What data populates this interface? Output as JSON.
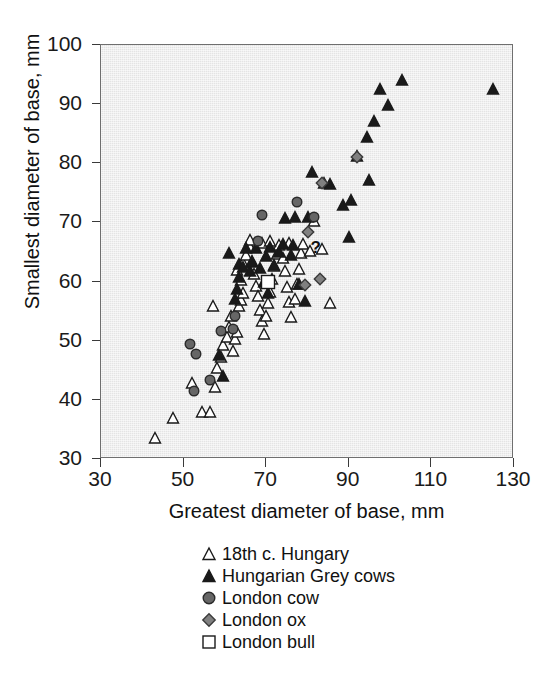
{
  "chart_data": {
    "type": "scatter",
    "title": "",
    "xlabel": "Greatest diameter of base, mm",
    "ylabel": "Smallest diameter of base, mm",
    "xlim": [
      30,
      130
    ],
    "ylim": [
      30,
      100
    ],
    "xticks": [
      30,
      50,
      70,
      90,
      110,
      130
    ],
    "yticks": [
      30,
      40,
      50,
      60,
      70,
      80,
      90,
      100
    ],
    "grid": false,
    "legend_position": "below-axes-center",
    "plot_background": "#e4e4e4",
    "annotations": [
      {
        "text": "?",
        "x": 82.0,
        "y": 65.6
      }
    ],
    "series": [
      {
        "name": "18th c. Hungary",
        "marker": "triangle-up",
        "fill": "#ffffff",
        "edge": "#1a1a1a",
        "points": [
          [
            43.0,
            33.6
          ],
          [
            47.5,
            37.0
          ],
          [
            52.0,
            42.9
          ],
          [
            54.5,
            38.0
          ],
          [
            56.5,
            38.0
          ],
          [
            57.5,
            42.1
          ],
          [
            58.0,
            45.4
          ],
          [
            59.0,
            47.3
          ],
          [
            59.5,
            49.2
          ],
          [
            60.5,
            50.6
          ],
          [
            61.0,
            52.3
          ],
          [
            61.5,
            54.1
          ],
          [
            62.0,
            48.2
          ],
          [
            62.5,
            50.3
          ],
          [
            63.0,
            51.5
          ],
          [
            63.5,
            55.8
          ],
          [
            64.0,
            56.9
          ],
          [
            64.5,
            58.0
          ],
          [
            64.0,
            60.2
          ],
          [
            63.0,
            62.0
          ],
          [
            64.5,
            63.1
          ],
          [
            65.0,
            64.5
          ],
          [
            66.0,
            65.8
          ],
          [
            66.5,
            63.4
          ],
          [
            67.0,
            61.2
          ],
          [
            67.5,
            59.3
          ],
          [
            68.0,
            57.6
          ],
          [
            68.5,
            55.2
          ],
          [
            69.0,
            53.3
          ],
          [
            69.5,
            51.2
          ],
          [
            70.0,
            54.2
          ],
          [
            70.5,
            56.4
          ],
          [
            71.0,
            58.3
          ],
          [
            71.5,
            60.4
          ],
          [
            72.0,
            62.6
          ],
          [
            72.5,
            64.6
          ],
          [
            73.0,
            66.2
          ],
          [
            74.0,
            64.0
          ],
          [
            74.5,
            61.8
          ],
          [
            75.0,
            59.1
          ],
          [
            75.5,
            56.6
          ],
          [
            76.0,
            54.0
          ],
          [
            77.0,
            57.1
          ],
          [
            77.5,
            59.6
          ],
          [
            78.0,
            62.1
          ],
          [
            78.5,
            64.8
          ],
          [
            79.0,
            66.4
          ],
          [
            80.5,
            65.1
          ],
          [
            81.5,
            70.3
          ],
          [
            83.5,
            65.5
          ],
          [
            85.5,
            56.3
          ],
          [
            57.0,
            55.8
          ],
          [
            66.0,
            67.0
          ],
          [
            69.0,
            66.6
          ],
          [
            71.0,
            66.9
          ],
          [
            75.5,
            66.6
          ]
        ]
      },
      {
        "name": "Hungarian Grey cows",
        "marker": "triangle-up",
        "fill": "#1a1a1a",
        "edge": "#1a1a1a",
        "points": [
          [
            59.5,
            44.0
          ],
          [
            58.5,
            47.6
          ],
          [
            62.5,
            57.0
          ],
          [
            63.0,
            58.8
          ],
          [
            63.5,
            60.7
          ],
          [
            61.0,
            64.9
          ],
          [
            63.5,
            63.0
          ],
          [
            64.5,
            62.4
          ],
          [
            65.0,
            65.6
          ],
          [
            66.0,
            61.8
          ],
          [
            66.5,
            63.3
          ],
          [
            67.5,
            65.7
          ],
          [
            68.5,
            62.3
          ],
          [
            69.5,
            60.0
          ],
          [
            70.5,
            58.0
          ],
          [
            70.0,
            64.3
          ],
          [
            71.0,
            65.9
          ],
          [
            72.0,
            62.8
          ],
          [
            73.0,
            65.0
          ],
          [
            74.0,
            66.3
          ],
          [
            74.5,
            70.7
          ],
          [
            76.0,
            64.5
          ],
          [
            76.5,
            66.2
          ],
          [
            77.0,
            71.0
          ],
          [
            78.0,
            59.6
          ],
          [
            79.5,
            56.7
          ],
          [
            80.0,
            70.9
          ],
          [
            81.0,
            78.6
          ],
          [
            84.0,
            76.6
          ],
          [
            85.5,
            76.5
          ],
          [
            88.5,
            72.9
          ],
          [
            90.0,
            67.5
          ],
          [
            90.5,
            73.8
          ],
          [
            92.0,
            81.2
          ],
          [
            94.5,
            84.4
          ],
          [
            95.0,
            77.1
          ],
          [
            96.0,
            87.1
          ],
          [
            97.5,
            92.6
          ],
          [
            99.5,
            89.9
          ],
          [
            103.0,
            94.0
          ],
          [
            125.0,
            92.6
          ]
        ]
      },
      {
        "name": "London cow",
        "marker": "circle",
        "fill": "#666666",
        "edge": "#2b2b2b",
        "points": [
          [
            52.5,
            41.5
          ],
          [
            53.0,
            47.8
          ],
          [
            56.5,
            43.3
          ],
          [
            59.0,
            51.6
          ],
          [
            62.0,
            51.9
          ],
          [
            62.5,
            54.2
          ],
          [
            69.0,
            71.3
          ],
          [
            68.0,
            66.8
          ],
          [
            77.5,
            73.4
          ],
          [
            81.5,
            70.9
          ],
          [
            51.5,
            49.5
          ]
        ]
      },
      {
        "name": "London ox",
        "marker": "diamond",
        "fill": "#808080",
        "edge": "#3a3a3a",
        "points": [
          [
            79.5,
            59.5
          ],
          [
            83.0,
            60.5
          ],
          [
            80.0,
            68.3
          ],
          [
            83.5,
            76.7
          ],
          [
            92.0,
            81.1
          ]
        ]
      },
      {
        "name": "London bull",
        "marker": "square",
        "fill": "#ffffff",
        "edge": "#1a1a1a",
        "points": [
          [
            70.5,
            59.9
          ]
        ]
      }
    ]
  },
  "axes": {
    "x_label": "Greatest diameter of base, mm",
    "y_label": "Smallest diameter of base, mm",
    "x_tick_labels": [
      "30",
      "50",
      "70",
      "90",
      "110",
      "130"
    ],
    "y_tick_labels": [
      "100",
      "90",
      "80",
      "70",
      "60",
      "50",
      "40",
      "30"
    ]
  },
  "legend": {
    "items": [
      {
        "label": "18th c. Hungary",
        "marker": "triangle-up-open",
        "fill": "#ffffff",
        "edge": "#1a1a1a"
      },
      {
        "label": "Hungarian Grey cows",
        "marker": "triangle-up-filled",
        "fill": "#1a1a1a",
        "edge": "#1a1a1a"
      },
      {
        "label": "London cow",
        "marker": "circle-filled",
        "fill": "#666666",
        "edge": "#2b2b2b"
      },
      {
        "label": "London ox",
        "marker": "diamond-filled",
        "fill": "#808080",
        "edge": "#3a3a3a"
      },
      {
        "label": "London bull",
        "marker": "square-open",
        "fill": "#ffffff",
        "edge": "#1a1a1a"
      }
    ]
  }
}
